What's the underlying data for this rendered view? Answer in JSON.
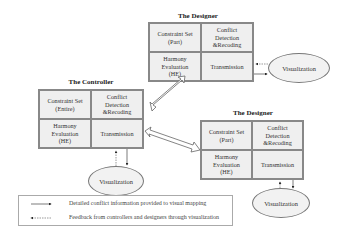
{
  "nodes": {
    "designer_top": {
      "title": "The Designer",
      "cells": [
        "Constraint Set\n(Part)",
        "Conflict\nDetection\n&Recoding",
        "Harmony\nEvaluation\n(HE)",
        "Transmission"
      ],
      "visualization": "Visualization"
    },
    "controller": {
      "title": "The Controller",
      "cells": [
        "Constraint Set\n(Entire)",
        "Conflict\nDetection\n&Recoding",
        "Harmony\nEvaluation\n(HE)",
        "Transmission"
      ],
      "visualization": "Visualization"
    },
    "designer_right": {
      "title": "The Designer",
      "cells": [
        "Constraint Set\n(Part)",
        "Conflict\nDetection\n&Recoding",
        "Harmony\nEvaluation\n(HE)",
        "Transmission"
      ],
      "visualization": "Visualization"
    }
  },
  "legend": {
    "items": [
      {
        "style": "solid-arrow",
        "label": "Detailed conflict information provided to visual mapping"
      },
      {
        "style": "dashed-arrow",
        "label": "Feedback from controllers and designers through visualization"
      }
    ]
  }
}
